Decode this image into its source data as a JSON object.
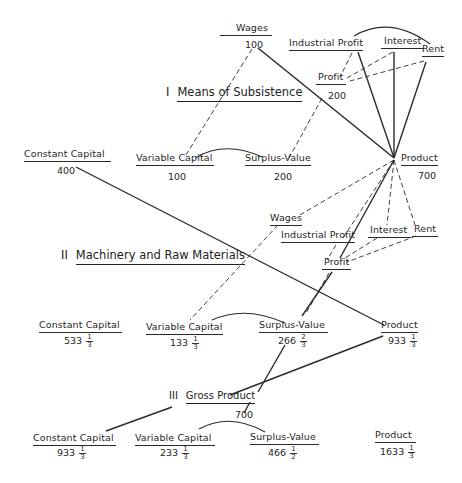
{
  "sections": {
    "I": {
      "numeral": "I",
      "title": "Means of Subsistence"
    },
    "II": {
      "numeral": "II",
      "title": "Machinery and Raw Materials"
    },
    "III": {
      "numeral": "III",
      "title": "Gross Product",
      "value": "700"
    }
  },
  "nodes": {
    "top_constant_capital": {
      "label": "Constant Capital",
      "value": "400"
    },
    "I_wages": {
      "label": "Wages",
      "value": "100"
    },
    "I_industrial_profit": {
      "label": "Industrial  Profit"
    },
    "I_interest": {
      "label": "Interest"
    },
    "I_rent": {
      "label": "Rent"
    },
    "I_profit": {
      "label": "Profit",
      "value": "200"
    },
    "I_variable_capital": {
      "label": "Variable Capital",
      "value": "100"
    },
    "I_surplus_value": {
      "label": "Surplus-Value",
      "value": "200"
    },
    "I_product": {
      "label": "Product",
      "value": "700"
    },
    "II_wages": {
      "label": "Wages"
    },
    "II_industrial_profit": {
      "label": "Industrial Profit"
    },
    "II_interest": {
      "label": "Interest"
    },
    "II_rent": {
      "label": "Rent"
    },
    "II_profit": {
      "label": "Profit"
    },
    "II_constant_capital": {
      "label": "Constant Capital",
      "whole": "533",
      "num": "1",
      "den": "3"
    },
    "II_variable_capital": {
      "label": "Variable Capital",
      "whole": "133",
      "num": "1",
      "den": "3"
    },
    "II_surplus_value": {
      "label": "Surplus-Value",
      "whole": "266",
      "num": "2",
      "den": "3"
    },
    "II_product": {
      "label": "Product",
      "whole": "933",
      "num": "1",
      "den": "3"
    },
    "III_constant_capital": {
      "label": "Constant Capital",
      "whole": "933",
      "num": "1",
      "den": "3"
    },
    "III_variable_capital": {
      "label": "Variable Capital",
      "whole": "233",
      "num": "1",
      "den": "3"
    },
    "III_surplus_value": {
      "label": "Surplus-Value",
      "whole": "466",
      "num": "1",
      "den": "2"
    },
    "III_product": {
      "label": "Product",
      "whole": "1633",
      "num": "1",
      "den": "3"
    }
  },
  "colors": {
    "line": "#2b2b2b",
    "text": "#262626",
    "background": "#ffffff"
  }
}
